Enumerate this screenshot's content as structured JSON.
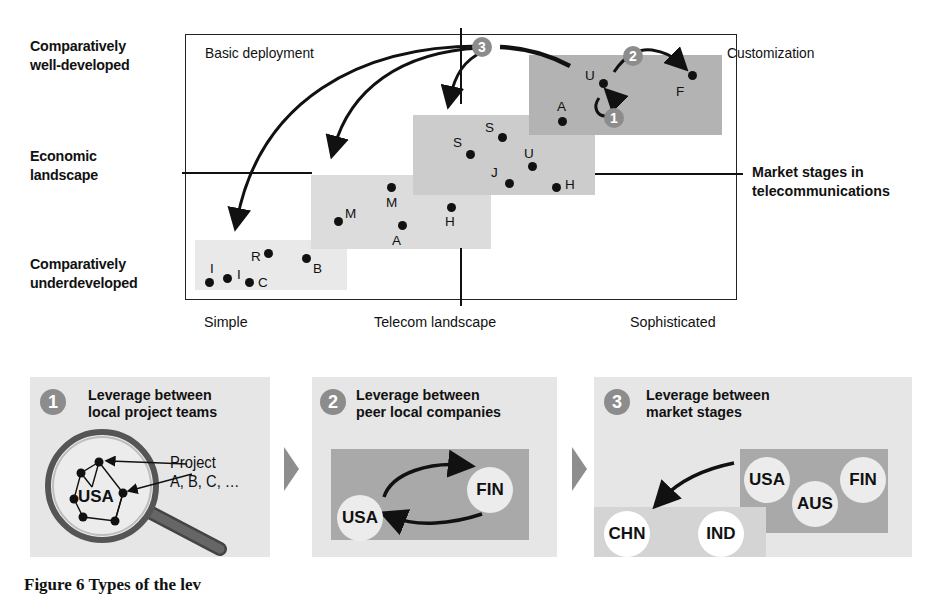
{
  "diagram": {
    "y_axis": {
      "top_label": "Comparatively well-developed",
      "top_lines": [
        "Comparatively",
        "well-developed"
      ],
      "middle_lines": [
        "Economic",
        "landscape"
      ],
      "bottom_lines": [
        "Comparatively",
        "underdeveloped"
      ]
    },
    "x_axis": {
      "left": "Simple",
      "middle": "Telecom landscape",
      "right": "Sophisticated"
    },
    "market_stages_label": [
      "Market stages in",
      "telecommunications"
    ],
    "corner_labels": {
      "top_left": "Basic deployment",
      "top_right": "Customization"
    },
    "colors": {
      "zone_1": "#e9e9e9",
      "zone_2": "#dcdcdc",
      "zone_3": "#cccccc",
      "zone_4": "#b3b3b3",
      "badge": "#8c8c8c",
      "panel_bg": "#e6e6e6",
      "panel_dark": "#a9a9a9"
    },
    "zones": [
      {
        "name": "stage-1",
        "points": [
          {
            "label": "I",
            "x": 209,
            "y": 283
          },
          {
            "label": "I",
            "x": 227,
            "y": 279
          },
          {
            "label": "C",
            "x": 249,
            "y": 282
          },
          {
            "label": "R",
            "x": 268,
            "y": 254
          },
          {
            "label": "B",
            "x": 306,
            "y": 259
          }
        ]
      },
      {
        "name": "stage-2",
        "points": [
          {
            "label": "M",
            "x": 338,
            "y": 221
          },
          {
            "label": "M",
            "x": 391,
            "y": 187
          },
          {
            "label": "A",
            "x": 402,
            "y": 225
          },
          {
            "label": "H",
            "x": 451,
            "y": 207
          }
        ]
      },
      {
        "name": "stage-3",
        "points": [
          {
            "label": "S",
            "x": 470,
            "y": 154
          },
          {
            "label": "S",
            "x": 502,
            "y": 137
          },
          {
            "label": "U",
            "x": 532,
            "y": 166
          },
          {
            "label": "J",
            "x": 509,
            "y": 183
          },
          {
            "label": "H",
            "x": 556,
            "y": 187
          }
        ]
      },
      {
        "name": "stage-4",
        "points": [
          {
            "label": "A",
            "x": 562,
            "y": 121
          },
          {
            "label": "U",
            "x": 603,
            "y": 83
          },
          {
            "label": "F",
            "x": 692,
            "y": 75
          }
        ]
      }
    ],
    "badges": [
      "1",
      "2",
      "3"
    ]
  },
  "panels": [
    {
      "number": "1",
      "title_lines": [
        "Leverage between",
        "local project teams"
      ],
      "center_label": "USA",
      "annotation_lines": [
        "Project",
        "A, B, C, …"
      ]
    },
    {
      "number": "2",
      "title_lines": [
        "Leverage between",
        "peer local companies"
      ],
      "circles": [
        "USA",
        "FIN"
      ]
    },
    {
      "number": "3",
      "title_lines": [
        "Leverage between",
        "market stages"
      ],
      "developed_circles": [
        "USA",
        "AUS",
        "FIN"
      ],
      "developing_circles": [
        "CHN",
        "IND"
      ]
    }
  ],
  "caption": "Figure 6  Types of the lev"
}
